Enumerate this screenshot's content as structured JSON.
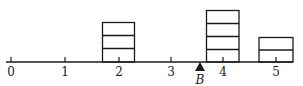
{
  "diagram": {
    "type": "balance-beam",
    "axis": {
      "ticks": [
        {
          "value": 0,
          "label": "0",
          "x": 11
        },
        {
          "value": 1,
          "label": "1",
          "x": 65
        },
        {
          "value": 2,
          "label": "2",
          "x": 119
        },
        {
          "value": 3,
          "label": "3",
          "x": 171
        },
        {
          "value": 4,
          "label": "4",
          "x": 223
        },
        {
          "value": 5,
          "label": "5",
          "x": 276
        }
      ]
    },
    "fulcrum": {
      "label": "B",
      "position": 3.55
    },
    "stacks": [
      {
        "position": 2,
        "count": 3
      },
      {
        "position": 4,
        "count": 4
      },
      {
        "position": 5,
        "count": 2
      }
    ]
  },
  "colors": {
    "stroke": "#1a1a1a",
    "background": "#ffffff"
  }
}
